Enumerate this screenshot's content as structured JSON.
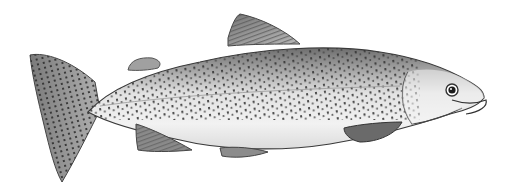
{
  "image": {
    "subject": "Rainbow trout illustration",
    "style": "pencil / stippled drawing",
    "orientation": "facing right",
    "background_color": "#ffffff",
    "ink_color": "#2a2a2a",
    "body_shade": "#e8e8e8",
    "back_shade": "#8a8a8a",
    "parts": [
      "caudal-fin",
      "dorsal-fin",
      "adipose-fin",
      "pectoral-fin",
      "pelvic-fin",
      "anal-fin",
      "head",
      "eye",
      "gill-cover",
      "spots"
    ]
  }
}
